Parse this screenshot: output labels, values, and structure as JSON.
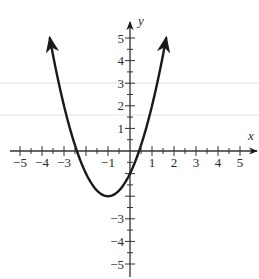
{
  "chart_data": {
    "type": "line",
    "title": "",
    "xlabel": "x",
    "ylabel": "y",
    "xlim": [
      -5,
      5
    ],
    "ylim": [
      -5,
      5
    ],
    "grid": false,
    "x_ticks": [
      -5,
      -4,
      -3,
      -2,
      -1,
      1,
      2,
      3,
      4,
      5
    ],
    "x_tick_labels": [
      "-5",
      "-4",
      "-3",
      "",
      "-1",
      "1",
      "2",
      "3",
      "4",
      "5"
    ],
    "y_ticks": [
      -5,
      -4,
      -3,
      -2,
      -1,
      1,
      2,
      3,
      4,
      5
    ],
    "y_tick_labels": [
      "-5",
      "-4",
      "-3",
      "",
      "",
      "1",
      "2",
      "3",
      "4",
      "5"
    ],
    "minor_ticks_per_unit": 2,
    "series": [
      {
        "name": "parabola",
        "equation": "y = (x + 1)^2 - 2",
        "vertex": [
          -1,
          -2
        ],
        "x_intercepts": [
          -2.41,
          0.41
        ],
        "y_intercept": -1,
        "arrows_at_ends": true,
        "x": [
          -3.65,
          -3.5,
          -3,
          -2.5,
          -2,
          -1.5,
          -1,
          -0.5,
          0,
          0.5,
          1,
          1.5,
          1.65
        ],
        "values": [
          5.02,
          4.25,
          2,
          0.25,
          -1,
          -1.75,
          -2,
          -1.75,
          -1,
          0.25,
          2,
          4.25,
          5.02
        ],
        "color": "#1a1a1a"
      }
    ]
  },
  "colors": {
    "ink": "#1a1a1a",
    "axis": "#333333",
    "scan_line": "#e6e6e6"
  }
}
